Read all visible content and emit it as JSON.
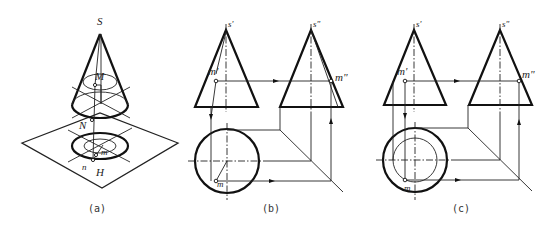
{
  "figure": {
    "panels": [
      {
        "id": "a",
        "caption": "(a)",
        "type": "isometric-view",
        "labels": {
          "apex": "S",
          "point_upper": "M",
          "point_mid": "N",
          "projection_m": "m",
          "projection_n": "n",
          "plane": "H"
        }
      },
      {
        "id": "b",
        "caption": "(b)",
        "type": "three-view-projection",
        "labels": {
          "front_apex": "s'",
          "side_apex": "s\"",
          "front_point": "m'",
          "side_point": "m\"",
          "top_point": "m"
        }
      },
      {
        "id": "c",
        "caption": "(c)",
        "type": "three-view-projection",
        "labels": {
          "front_apex": "s'",
          "side_apex": "s\"",
          "front_point": "m'",
          "side_point": "m\"",
          "top_point": "m"
        }
      }
    ]
  }
}
